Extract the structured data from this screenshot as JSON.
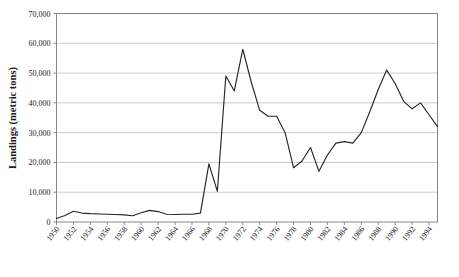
{
  "chart_data": {
    "type": "line",
    "title": "",
    "xlabel": "",
    "ylabel": "Landings (metric tons)",
    "ylim": [
      0,
      70000
    ],
    "xlim": [
      1950,
      1995
    ],
    "grid": true,
    "legend": false,
    "y_ticks": [
      "0",
      "10,000",
      "20,000",
      "30,000",
      "40,000",
      "50,000",
      "60,000",
      "70,000"
    ],
    "y_tick_values": [
      0,
      10000,
      20000,
      30000,
      40000,
      50000,
      60000,
      70000
    ],
    "x_tick_labels": [
      "1950",
      "1952",
      "1954",
      "1956",
      "1958",
      "1960",
      "1962",
      "1964",
      "1966",
      "1968",
      "1970",
      "1972",
      "1974",
      "1976",
      "1978",
      "1980",
      "1982",
      "1984",
      "1986",
      "1988",
      "1990",
      "1992",
      "1994"
    ],
    "x_tick_values": [
      1950,
      1952,
      1954,
      1956,
      1958,
      1960,
      1962,
      1964,
      1966,
      1968,
      1970,
      1972,
      1974,
      1976,
      1978,
      1980,
      1982,
      1984,
      1986,
      1988,
      1990,
      1992,
      1994
    ],
    "x": [
      1950,
      1951,
      1952,
      1953,
      1954,
      1955,
      1956,
      1957,
      1958,
      1959,
      1960,
      1961,
      1962,
      1963,
      1964,
      1965,
      1966,
      1967,
      1968,
      1969,
      1970,
      1971,
      1972,
      1973,
      1974,
      1975,
      1976,
      1977,
      1978,
      1979,
      1980,
      1981,
      1982,
      1983,
      1984,
      1985,
      1986,
      1987,
      1988,
      1989,
      1990,
      1991,
      1992,
      1993,
      1994,
      1995
    ],
    "values": [
      1200,
      2200,
      3600,
      3000,
      2800,
      2700,
      2600,
      2500,
      2400,
      2100,
      3100,
      3900,
      3500,
      2600,
      2500,
      2600,
      2600,
      3000,
      19500,
      10300,
      49000,
      44000,
      58000,
      47000,
      37500,
      35500,
      35500,
      30000,
      18200,
      20500,
      25000,
      17000,
      22500,
      26500,
      27000,
      26500,
      30000,
      37000,
      44500,
      51000,
      46500,
      40500,
      38000,
      40000,
      36000,
      32000
    ],
    "series_name": "Landings",
    "line_color": "#262626",
    "grid_color": "#b4b4b4"
  },
  "axes": {
    "y_axis_title": "Landings (metric tons)"
  }
}
